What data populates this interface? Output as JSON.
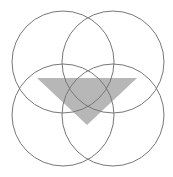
{
  "diagram": {
    "width": 173,
    "height": 177,
    "background": "#ffffff",
    "circles": [
      {
        "id": "top-left",
        "cx": 63,
        "cy": 62,
        "r": 51
      },
      {
        "id": "top-right",
        "cx": 113,
        "cy": 62,
        "r": 51
      },
      {
        "id": "bottom-left",
        "cx": 63,
        "cy": 115,
        "r": 51
      },
      {
        "id": "bottom-right",
        "cx": 113,
        "cy": 115,
        "r": 51
      }
    ],
    "circle_stroke": "#777777",
    "circle_stroke_width": 1,
    "triangle": {
      "points": "37,78 137,78 87,125",
      "fill": "#aaaaaa",
      "opacity": 0.85
    }
  }
}
